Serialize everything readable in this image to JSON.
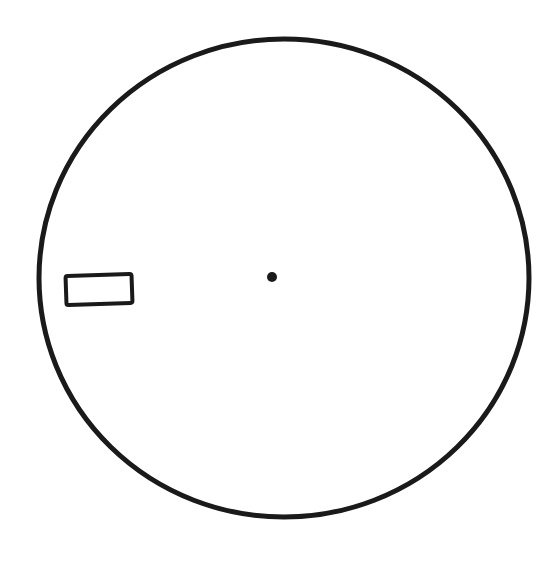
{
  "diagram": {
    "background": "#ffffff",
    "stroke_color": "#1a1a1a",
    "circle": {
      "cx": 284,
      "cy": 278,
      "rx": 245,
      "ry": 239,
      "stroke_width": 5
    },
    "center_dot": {
      "cx": 272,
      "cy": 277,
      "r": 5
    },
    "rectangle": {
      "x": 66,
      "y": 275,
      "width": 66,
      "height": 29,
      "rotation": -2,
      "stroke_width": 4
    }
  }
}
